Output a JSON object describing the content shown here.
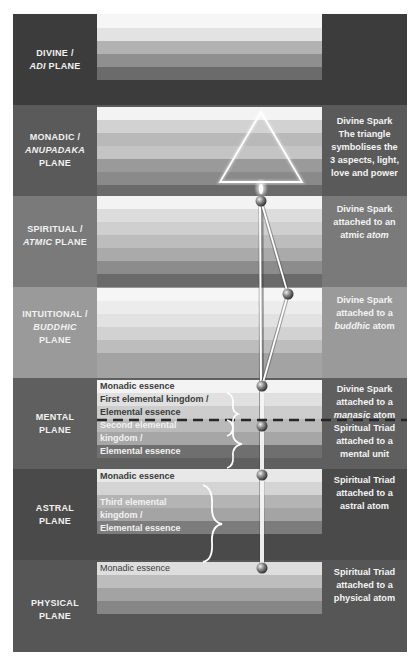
{
  "planes": [
    {
      "id": "divine",
      "label_line1": "DIVINE /",
      "label_italic": "ADI",
      "label_rest": " PLANE",
      "bg": "#3c3c3c",
      "description": ""
    },
    {
      "id": "monadic",
      "label_line1": "MONADIC /",
      "label_italic": "ANUPADAKA",
      "label_rest": "PLANE",
      "bg": "#5a5a5a",
      "description_lines": [
        "Divine Spark",
        "The triangle",
        "symbolises the",
        "3 aspects, light,",
        "love and power"
      ]
    },
    {
      "id": "spiritual",
      "label_line1": "SPIRITUAL /",
      "label_italic": "ATMIC",
      "label_rest": " PLANE",
      "bg": "#7a7a7a",
      "description_lines": [
        "Divine Spark",
        "attached to an"
      ],
      "description_last_plain": "atmic ",
      "description_last_italic": "atom"
    },
    {
      "id": "intuitional",
      "label_line1": "INTUITIONAL /",
      "label_italic": "BUDDHIC",
      "label_rest": "PLANE",
      "bg": "#9a9a9a",
      "description_lines": [
        "Divine Spark",
        "attached to a"
      ],
      "description_last_italic": "buddhic",
      "description_last_plain": " atom"
    },
    {
      "id": "mental",
      "label_line1": "MENTAL",
      "label_rest": "PLANE",
      "bg": "#5f5f5f",
      "description_lines": [
        "Divine Spark",
        "attached to a"
      ],
      "description_last_italic": "manasic",
      "description_last_plain": " atom",
      "description2_lines": [
        "Spiritual Triad",
        "attached to a",
        "mental unit"
      ],
      "band_texts": [
        "Monadic essence",
        "First elemental kingdom /",
        "Elemental essence",
        "Second elemental",
        "kingdom /",
        "Elemental essence"
      ]
    },
    {
      "id": "astral",
      "label_line1": "ASTRAL",
      "label_rest": "PLANE",
      "bg": "#4a4a4a",
      "description_lines": [
        "Spiritual Triad",
        "attached to a",
        "astral atom"
      ],
      "band_texts": [
        "Monadic essence",
        "Third elemental",
        "kingdom /",
        "Elemental essence"
      ]
    },
    {
      "id": "physical",
      "label_line1": "PHYSICAL",
      "label_rest": "PLANE",
      "bg": "#565656",
      "description_lines": [
        "Spiritual Triad",
        "attached to a",
        "physical atom"
      ],
      "band_texts": [
        "Monadic essence"
      ]
    }
  ],
  "colors": {
    "divine": "#3c3c3c",
    "monadic": "#5a5a5a",
    "spiritual": "#7a7a7a",
    "intuitional": "#9a9a9a",
    "mental": "#5f5f5f",
    "astral": "#4a4a4a",
    "physical": "#565656",
    "line": "#ffffff",
    "dashed": "#2a2a2a"
  },
  "icons": [
    "triangle-icon",
    "flame-icon",
    "sphere-icon",
    "brace-icon",
    "dashed-divider"
  ]
}
